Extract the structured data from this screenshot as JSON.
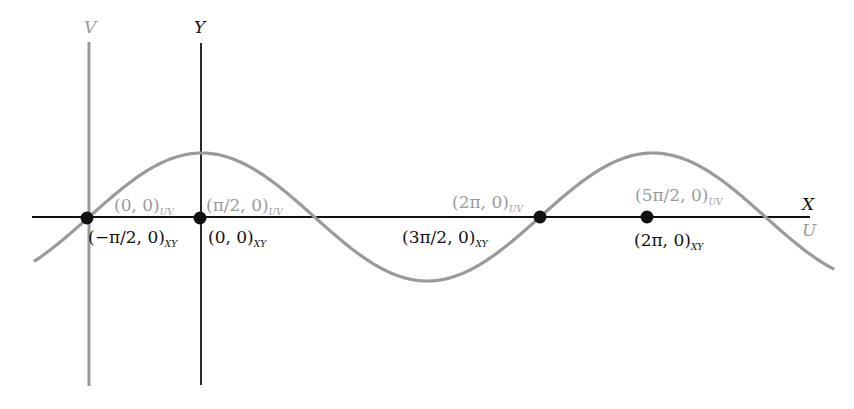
{
  "colors": {
    "xy": "#111111",
    "uv": "#9a9a9a",
    "point": "#111111"
  },
  "axes": {
    "x_label": "X",
    "y_label": "Y",
    "u_label": "U",
    "v_label": "V"
  },
  "curve": {
    "description": "sine curve (cos in XY frame, sin in UV frame)",
    "x_start_px": 35,
    "x_end_px": 833,
    "baseline_px": 217,
    "amplitude_px": 64,
    "period_px": 451,
    "zero_px": 89
  },
  "points": [
    {
      "cx": 87,
      "cy": 218,
      "uv_main": "(0, 0)",
      "uv_sub": "UV",
      "xy_main": "(−π/2, 0)",
      "xy_sub": "XY"
    },
    {
      "cx": 200,
      "cy": 218,
      "uv_main": "(π/2, 0)",
      "uv_sub": "UV",
      "xy_main": "(0, 0)",
      "xy_sub": "XY"
    },
    {
      "cx": 540,
      "cy": 217,
      "uv_main": "(2π, 0)",
      "uv_sub": "UV",
      "xy_main": "(3π/2, 0)",
      "xy_sub": "XY"
    },
    {
      "cx": 647,
      "cy": 217,
      "uv_main": "(5π/2, 0)",
      "uv_sub": "UV",
      "xy_main": "(2π, 0)",
      "xy_sub": "XY"
    }
  ]
}
